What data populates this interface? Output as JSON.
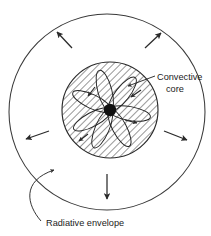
{
  "figure": {
    "background_color": "#ffffff",
    "line_color": "#2a2a2a",
    "hatch_color": "#3a3a3a",
    "text_color": "#1b1b1b"
  },
  "labels": {
    "convective_core_line1": "Convective",
    "convective_core_line2": "core",
    "radiative_envelope": "Radiative envelope"
  },
  "regions": {
    "envelope": {
      "name": "Radiative envelope",
      "shape": "circle",
      "center_x": 107,
      "center_y": 112,
      "radius": 98,
      "fill": "none",
      "stroke": "#3a3a3a"
    },
    "core": {
      "name": "Convective core",
      "shape": "circle",
      "center_x": 110,
      "center_y": 110,
      "radius": 48,
      "fill": "hatched",
      "hatch_angle_deg": 45,
      "stroke": "#2a2a2a"
    },
    "center_blob": {
      "name": "Core center",
      "shape": "circle",
      "center_x": 110,
      "center_y": 110,
      "radius": 6,
      "fill": "#111111"
    }
  },
  "convection_cells": {
    "count": 7,
    "description": "Elliptical convection loops radiating from core center",
    "petal_length": 40,
    "petal_width": 13,
    "angles_deg": [
      10,
      62,
      113,
      152,
      205,
      255,
      308
    ]
  },
  "flow_arrows": {
    "count": 5,
    "description": "Outward energy-transport arrows in the radiative envelope",
    "items": [
      {
        "name": "arrow-up-left",
        "x1": 72,
        "y1": 48,
        "x2": 57,
        "y2": 32
      },
      {
        "name": "arrow-up-right",
        "x1": 145,
        "y1": 48,
        "x2": 161,
        "y2": 33
      },
      {
        "name": "arrow-left",
        "x1": 49,
        "y1": 131,
        "x2": 26,
        "y2": 139
      },
      {
        "name": "arrow-right",
        "x1": 164,
        "y1": 131,
        "x2": 187,
        "y2": 140
      },
      {
        "name": "arrow-down",
        "x1": 107,
        "y1": 174,
        "x2": 107,
        "y2": 199
      }
    ]
  },
  "leaders": {
    "core_leader": {
      "name": "Convective core leader",
      "path": "M 155 76 L 128 86",
      "arrow_at": "end"
    },
    "envelope_leader": {
      "name": "Radiative envelope leader",
      "path": "M 41 221 C 28 206, 22 182, 55 170",
      "arrow_at": "end"
    }
  },
  "text_positions": {
    "convective_core_x": 157,
    "convective_core_y1": 80,
    "convective_core_y2": 92,
    "radiative_envelope_x": 46,
    "radiative_envelope_y": 226
  }
}
